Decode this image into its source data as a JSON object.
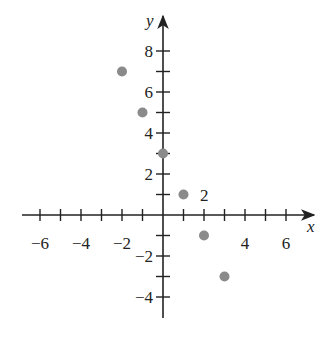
{
  "chart_data": {
    "type": "scatter",
    "title": "",
    "xlabel": "x",
    "ylabel": "y",
    "xlim": [
      -7,
      7
    ],
    "ylim": [
      -5,
      9
    ],
    "grid": false,
    "x_tick_labels": [
      "−6",
      "−4",
      "−2",
      "4",
      "6"
    ],
    "x_tick_values": [
      -6,
      -4,
      -2,
      4,
      6
    ],
    "y_tick_labels": [
      "8",
      "6",
      "4",
      "2",
      "−2",
      "−4"
    ],
    "y_tick_values": [
      8,
      6,
      4,
      2,
      -2,
      -4
    ],
    "x_ticks_all": [
      -6,
      -5,
      -4,
      -3,
      -2,
      -1,
      1,
      2,
      3,
      4,
      5,
      6
    ],
    "y_ticks_all": [
      -4,
      -3,
      -2,
      -1,
      1,
      2,
      3,
      4,
      5,
      6,
      7,
      8
    ],
    "points": [
      {
        "x": -2,
        "y": 7
      },
      {
        "x": -1,
        "y": 5
      },
      {
        "x": 0,
        "y": 3
      },
      {
        "x": 1,
        "y": 1
      },
      {
        "x": 2,
        "y": -1
      },
      {
        "x": 3,
        "y": -3
      }
    ],
    "annotations": [
      {
        "text": "2",
        "x": 1.8,
        "y": 1
      }
    ],
    "point_color": "#8a8a8a",
    "axis_color": "#222222"
  }
}
